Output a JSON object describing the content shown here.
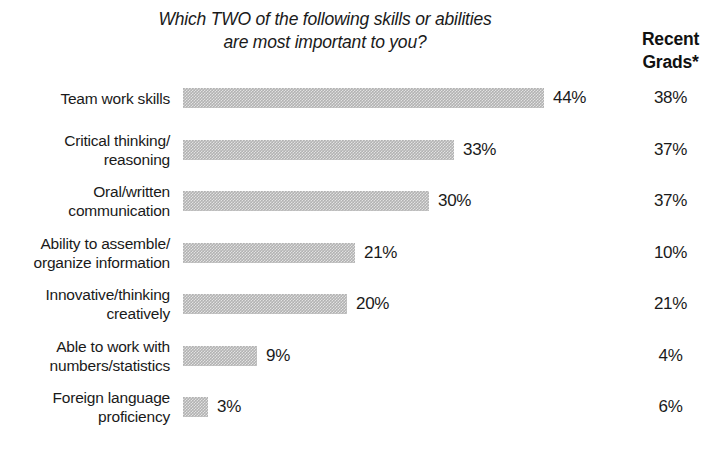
{
  "title": {
    "line1": "Which TWO of the following skills or abilities",
    "line2": "are most important to you?"
  },
  "column_header": {
    "line1": "Recent",
    "line2": "Grads*"
  },
  "chart_data": {
    "type": "bar",
    "orientation": "horizontal",
    "title": "Which TWO of the following skills or abilities are most important to you?",
    "xlabel": "",
    "ylabel": "",
    "xlim": [
      0,
      50
    ],
    "grid": false,
    "legend": false,
    "value_suffix": "%",
    "bar_color": "#b2b2b2",
    "px_per_percent": 8.2,
    "categories": [
      "Team work skills",
      "Critical thinking/ reasoning",
      "Oral/written communication",
      "Ability to assemble/ organize information",
      "Innovative/thinking creatively",
      "Able to work with numbers/statistics",
      "Foreign language proficiency"
    ],
    "category_lines": [
      [
        "Team work skills"
      ],
      [
        "Critical thinking/",
        "reasoning"
      ],
      [
        "Oral/written",
        "communication"
      ],
      [
        "Ability to assemble/",
        "organize information"
      ],
      [
        "Innovative/thinking",
        "creatively"
      ],
      [
        "Able to work with",
        "numbers/statistics"
      ],
      [
        "Foreign language",
        "proficiency"
      ]
    ],
    "series": [
      {
        "name": "All respondents",
        "values": [
          44,
          33,
          30,
          21,
          20,
          9,
          3
        ],
        "labels": [
          "44%",
          "33%",
          "30%",
          "21%",
          "20%",
          "9%",
          "3%"
        ],
        "rendered_as": "bar"
      },
      {
        "name": "Recent Grads*",
        "values": [
          38,
          37,
          37,
          10,
          21,
          4,
          6
        ],
        "labels": [
          "38%",
          "37%",
          "37%",
          "10%",
          "21%",
          "4%",
          "6%"
        ],
        "rendered_as": "text-column"
      }
    ]
  }
}
